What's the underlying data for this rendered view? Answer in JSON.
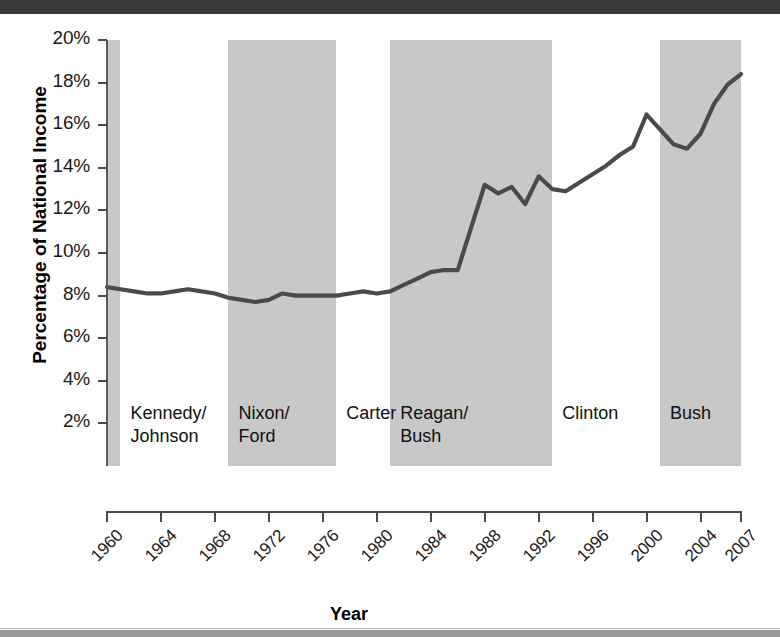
{
  "figure": {
    "ytitle": "Percentage of National Income",
    "xtitle": "Year",
    "line_color": "#4a4a4a",
    "band_color": "#c8c8c8",
    "background": "#ffffff"
  },
  "yaxis": {
    "ticks": [
      "20%",
      "18%",
      "16%",
      "14%",
      "12%",
      "10%",
      "8%",
      "6%",
      "4%",
      "2%"
    ],
    "min": 0,
    "max": 20
  },
  "xaxis": {
    "ticks": [
      "1960",
      "1964",
      "1968",
      "1972",
      "1976",
      "1980",
      "1984",
      "1988",
      "1992",
      "1996",
      "2000",
      "2004",
      "2007"
    ],
    "min": 1960,
    "max": 2007
  },
  "administrations": [
    {
      "label": "",
      "start": 1960,
      "end": 1961,
      "shaded": true
    },
    {
      "label": "Kennedy/\nJohnson",
      "line1": "Kennedy/",
      "line2": "Johnson",
      "start": 1961,
      "end": 1969,
      "shaded": false
    },
    {
      "label": "Nixon/\nFord",
      "line1": "Nixon/",
      "line2": "Ford",
      "start": 1969,
      "end": 1977,
      "shaded": true
    },
    {
      "label": "Carter",
      "line1": "Carter",
      "line2": "",
      "start": 1977,
      "end": 1981,
      "shaded": false
    },
    {
      "label": "Reagan/\nBush",
      "line1": "Reagan/",
      "line2": "Bush",
      "start": 1981,
      "end": 1993,
      "shaded": true
    },
    {
      "label": "Clinton",
      "line1": "Clinton",
      "line2": "",
      "start": 1993,
      "end": 2001,
      "shaded": false
    },
    {
      "label": "Bush",
      "line1": "Bush",
      "line2": "",
      "start": 2001,
      "end": 2007,
      "shaded": true
    }
  ],
  "chart_data": {
    "type": "line",
    "title": "",
    "xlabel": "Year",
    "ylabel": "Percentage of National Income",
    "xlim": [
      1960,
      2007
    ],
    "ylim": [
      0,
      20
    ],
    "grid": false,
    "legend": "none",
    "x": [
      1960,
      1961,
      1962,
      1963,
      1964,
      1965,
      1966,
      1967,
      1968,
      1969,
      1970,
      1971,
      1972,
      1973,
      1974,
      1975,
      1976,
      1977,
      1978,
      1979,
      1980,
      1981,
      1982,
      1983,
      1984,
      1985,
      1986,
      1987,
      1988,
      1989,
      1990,
      1991,
      1992,
      1993,
      1994,
      1995,
      1996,
      1997,
      1998,
      1999,
      2000,
      2001,
      2002,
      2003,
      2004,
      2005,
      2006,
      2007
    ],
    "values": [
      8.4,
      8.3,
      8.2,
      8.1,
      8.1,
      8.2,
      8.3,
      8.2,
      8.1,
      7.9,
      7.8,
      7.7,
      7.8,
      8.1,
      8.0,
      8.0,
      8.0,
      8.0,
      8.1,
      8.2,
      8.1,
      8.2,
      8.5,
      8.8,
      9.1,
      9.2,
      9.2,
      11.2,
      13.2,
      12.8,
      13.1,
      12.3,
      13.6,
      13.0,
      12.9,
      13.3,
      13.7,
      14.1,
      14.6,
      15.0,
      16.5,
      15.8,
      15.1,
      14.9,
      15.6,
      17.0,
      17.9,
      18.4
    ],
    "series_name": "Percentage of National Income",
    "annotations": [
      "Kennedy/Johnson",
      "Nixon/Ford",
      "Carter",
      "Reagan/Bush",
      "Clinton",
      "Bush"
    ],
    "shaded_periods": [
      [
        1960,
        1961
      ],
      [
        1969,
        1977
      ],
      [
        1981,
        1993
      ],
      [
        2001,
        2007
      ]
    ]
  }
}
